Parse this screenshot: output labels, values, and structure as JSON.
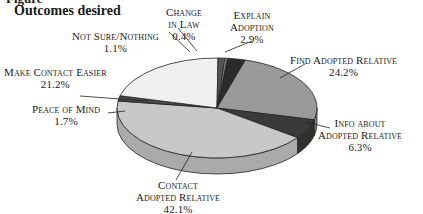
{
  "figure": {
    "cut_header": "Figure",
    "title": "Outcomes desired"
  },
  "chart_data": {
    "type": "pie",
    "style": "3d",
    "title": "Outcomes desired",
    "slices": [
      {
        "label": "Explain Adoption",
        "value": 2.9,
        "display": "2.9%",
        "color": "#2b2b2b"
      },
      {
        "label": "Find Adopted Relative",
        "value": 24.2,
        "display": "24.2%",
        "color": "#9a9a9a"
      },
      {
        "label": "Info about Adopted Relative",
        "value": 6.3,
        "display": "6.3%",
        "color": "#3a3a3a"
      },
      {
        "label": "Contact Adopted Relative",
        "value": 42.1,
        "display": "42.1%",
        "color": "#c8c8c8"
      },
      {
        "label": "Peace of Mind",
        "value": 1.7,
        "display": "1.7%",
        "color": "#4a4a4a"
      },
      {
        "label": "Make Contact Easier",
        "value": 21.2,
        "display": "21.2%",
        "color": "#f0f0f0"
      },
      {
        "label": "Not Sure/Nothing",
        "value": 1.1,
        "display": "1.1%",
        "color": "#555555"
      },
      {
        "label": "Change in Law",
        "value": 0.4,
        "display": "0.4%",
        "color": "#888888"
      }
    ],
    "legend": "none (direct labels with leader lines)"
  },
  "labels": {
    "explain": {
      "line1": "Explain",
      "line2": "Adoption",
      "pct": "2.9%"
    },
    "find": {
      "line1": "Find Adopted Relative",
      "pct": "24.2%"
    },
    "info": {
      "line1": "Info about",
      "line2": "Adopted Relative",
      "pct": "6.3%"
    },
    "contact": {
      "line1": "Contact",
      "line2": "Adopted Relative",
      "pct": "42.1%"
    },
    "peace": {
      "line1": "Peace of Mind",
      "pct": "1.7%"
    },
    "easier": {
      "line1": "Make Contact Easier",
      "pct": "21.2%"
    },
    "notsure": {
      "line1": "Not Sure/Nothing",
      "pct": "1.1%"
    },
    "law": {
      "line1": "Change",
      "line2": "in Law",
      "pct": "0.4%"
    }
  }
}
